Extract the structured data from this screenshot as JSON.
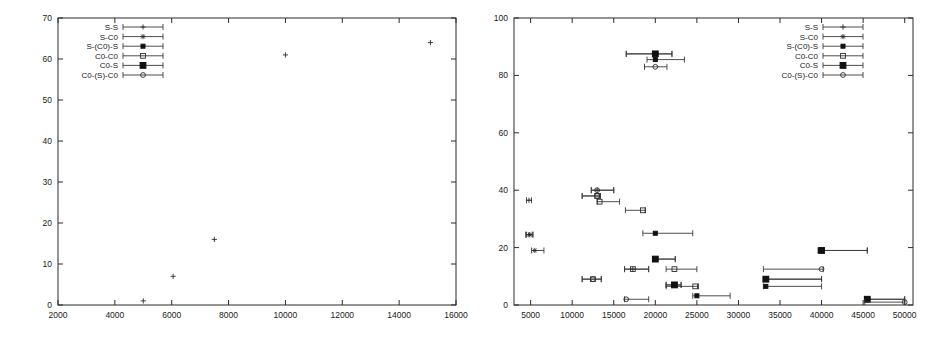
{
  "figure": {
    "panels": [
      "left-panel",
      "right-panel"
    ],
    "background": "#ffffff",
    "foreground": "#1a1a1a"
  },
  "legend_series": [
    {
      "key": "S-S",
      "label": "S-S",
      "marker": "plus"
    },
    {
      "key": "S-C0",
      "label": "S-C0",
      "marker": "asterisk"
    },
    {
      "key": "S-(C0)-S",
      "label": "S-(C0)-S",
      "marker": "filled-square-small"
    },
    {
      "key": "C0-C0",
      "label": "C0-C0",
      "marker": "open-square"
    },
    {
      "key": "C0-S",
      "label": "C0-S",
      "marker": "filled-square"
    },
    {
      "key": "C0-(S)-C0",
      "label": "C0-(S)-C0",
      "marker": "open-circle"
    }
  ],
  "chart_data": [
    {
      "id": "left-panel",
      "type": "scatter",
      "title": "",
      "xlabel": "",
      "ylabel": "",
      "xlim": [
        2000,
        16000
      ],
      "ylim": [
        0,
        70
      ],
      "xticks": [
        2000,
        4000,
        6000,
        8000,
        10000,
        12000,
        14000,
        16000
      ],
      "yticks": [
        0,
        10,
        20,
        30,
        40,
        50,
        60,
        70
      ],
      "xtick_labels": [
        "2000",
        "4000",
        "6000",
        "8000",
        "10000",
        "12000",
        "14000",
        "16000"
      ],
      "ytick_labels": [
        "0",
        "10",
        "20",
        "30",
        "40",
        "50",
        "60",
        "70"
      ],
      "grid": false,
      "legend_position": "top-left",
      "legend": [
        "S-S",
        "S-C0",
        "S-(C0)-S",
        "C0-C0",
        "C0-S",
        "C0-(S)-C0"
      ],
      "series": [
        {
          "name": "S-S",
          "marker": "plus",
          "points": [
            {
              "x": 5000,
              "y": 1,
              "xerr": 0
            },
            {
              "x": 6050,
              "y": 7,
              "xerr": 0
            },
            {
              "x": 7500,
              "y": 16,
              "xerr": 0
            },
            {
              "x": 10000,
              "y": 61,
              "xerr": 0
            },
            {
              "x": 15100,
              "y": 64,
              "xerr": 0
            }
          ]
        },
        {
          "name": "S-C0",
          "marker": "asterisk",
          "points": []
        },
        {
          "name": "S-(C0)-S",
          "marker": "filled-square-small",
          "points": []
        },
        {
          "name": "C0-C0",
          "marker": "open-square",
          "points": []
        },
        {
          "name": "C0-S",
          "marker": "filled-square",
          "points": []
        },
        {
          "name": "C0-(S)-C0",
          "marker": "open-circle",
          "points": []
        }
      ]
    },
    {
      "id": "right-panel",
      "type": "scatter",
      "title": "",
      "xlabel": "",
      "ylabel": "",
      "xlim": [
        3000,
        51000
      ],
      "ylim": [
        0,
        100
      ],
      "xticks": [
        5000,
        10000,
        15000,
        20000,
        25000,
        30000,
        35000,
        40000,
        45000,
        50000
      ],
      "yticks": [
        0,
        20,
        40,
        60,
        80,
        100
      ],
      "xtick_labels": [
        "5000",
        "10000",
        "15000",
        "20000",
        "25000",
        "30000",
        "35000",
        "40000",
        "45000",
        "50000"
      ],
      "ytick_labels": [
        "0",
        "20",
        "40",
        "60",
        "80",
        "100"
      ],
      "grid": false,
      "legend_position": "top-right",
      "legend": [
        "S-S",
        "S-C0",
        "S-(C0)-S",
        "C0-C0",
        "C0-S",
        "C0-(S)-C0"
      ],
      "series": [
        {
          "name": "S-S",
          "marker": "plus",
          "points": [
            {
              "x": 4800,
              "y": 36.5,
              "xlo": 4500,
              "xhi": 5100
            },
            {
              "x": 4800,
              "y": 24.5,
              "xlo": 4400,
              "xhi": 5200
            },
            {
              "x": 20000,
              "y": 87.5,
              "xlo": 16500,
              "xhi": 22000
            },
            {
              "x": 13000,
              "y": 40,
              "xlo": 12300,
              "xhi": 15000
            },
            {
              "x": 17300,
              "y": 12.5,
              "xlo": 16300,
              "xhi": 19200
            }
          ]
        },
        {
          "name": "S-C0",
          "marker": "asterisk",
          "points": [
            {
              "x": 4900,
              "y": 24.5,
              "xlo": 4500,
              "xhi": 5300
            },
            {
              "x": 5500,
              "y": 19,
              "xlo": 5100,
              "xhi": 6600
            }
          ]
        },
        {
          "name": "S-(C0)-S",
          "marker": "filled-square-small",
          "points": [
            {
              "x": 20000,
              "y": 85.5,
              "xlo": 19000,
              "xhi": 23500
            },
            {
              "x": 20000,
              "y": 25,
              "xlo": 18500,
              "xhi": 24500
            },
            {
              "x": 20000,
              "y": 16,
              "xlo": 19700,
              "xhi": 22400
            },
            {
              "x": 22300,
              "y": 7,
              "xlo": 21300,
              "xhi": 23100
            },
            {
              "x": 25000,
              "y": 3.2,
              "xlo": 24500,
              "xhi": 29000
            },
            {
              "x": 33300,
              "y": 9,
              "xlo": 33000,
              "xhi": 40000
            },
            {
              "x": 33300,
              "y": 6.5,
              "xlo": 33000,
              "xhi": 40000
            },
            {
              "x": 40000,
              "y": 19,
              "xlo": 39600,
              "xhi": 45500
            },
            {
              "x": 45500,
              "y": 2,
              "xlo": 45200,
              "xhi": 50000
            }
          ]
        },
        {
          "name": "C0-C0",
          "marker": "open-square",
          "points": [
            {
              "x": 13000,
              "y": 38,
              "xlo": 11200,
              "xhi": 13400
            },
            {
              "x": 13300,
              "y": 36,
              "xlo": 13000,
              "xhi": 15700
            },
            {
              "x": 18500,
              "y": 33,
              "xlo": 16400,
              "xhi": 18800
            },
            {
              "x": 17300,
              "y": 12.5,
              "xlo": 16300,
              "xhi": 19200
            },
            {
              "x": 22300,
              "y": 12.5,
              "xlo": 21300,
              "xhi": 25000
            },
            {
              "x": 24800,
              "y": 6.5,
              "xlo": 21300,
              "xhi": 25200
            },
            {
              "x": 12500,
              "y": 9,
              "xlo": 11200,
              "xhi": 13500
            }
          ]
        },
        {
          "name": "C0-S",
          "marker": "filled-square",
          "points": [
            {
              "x": 20000,
              "y": 87.5,
              "xlo": 16500,
              "xhi": 22000
            },
            {
              "x": 22300,
              "y": 7,
              "xlo": 21300,
              "xhi": 23100
            },
            {
              "x": 33300,
              "y": 9,
              "xlo": 33000,
              "xhi": 40000
            },
            {
              "x": 40000,
              "y": 19,
              "xlo": 39600,
              "xhi": 45500
            },
            {
              "x": 45500,
              "y": 2,
              "xlo": 45200,
              "xhi": 50000
            },
            {
              "x": 20000,
              "y": 16,
              "xlo": 19700,
              "xhi": 22400
            }
          ]
        },
        {
          "name": "C0-(S)-C0",
          "marker": "open-circle",
          "points": [
            {
              "x": 13000,
              "y": 40,
              "xlo": 12300,
              "xhi": 15000
            },
            {
              "x": 13000,
              "y": 38,
              "xlo": 11200,
              "xhi": 13400
            },
            {
              "x": 20000,
              "y": 83,
              "xlo": 18700,
              "xhi": 21400
            },
            {
              "x": 40000,
              "y": 12.5,
              "xlo": 33000,
              "xhi": 40200
            },
            {
              "x": 50000,
              "y": 1,
              "xlo": 45200,
              "xhi": 50000
            },
            {
              "x": 12500,
              "y": 9,
              "xlo": 11200,
              "xhi": 13500
            },
            {
              "x": 16500,
              "y": 2,
              "xlo": 16300,
              "xhi": 19200
            }
          ]
        }
      ]
    }
  ]
}
